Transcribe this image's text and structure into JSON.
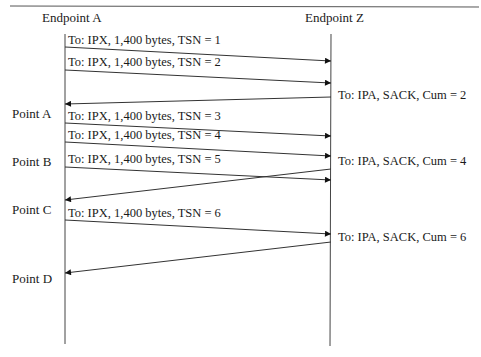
{
  "diagram": {
    "endpoints": {
      "left": {
        "label": "Endpoint A"
      },
      "right": {
        "label": "Endpoint Z"
      }
    },
    "points": [
      {
        "label": "Point A"
      },
      {
        "label": "Point B"
      },
      {
        "label": "Point C"
      },
      {
        "label": "Point D"
      }
    ],
    "messages": [
      {
        "direction": "A->Z",
        "label": "To: IPX, 1,400 bytes, TSN = 1"
      },
      {
        "direction": "A->Z",
        "label": "To: IPX, 1,400 bytes, TSN = 2"
      },
      {
        "direction": "Z->A",
        "label": "To: IPA, SACK, Cum = 2"
      },
      {
        "direction": "A->Z",
        "label": "To: IPX, 1,400 bytes, TSN = 3"
      },
      {
        "direction": "A->Z",
        "label": "To: IPX, 1,400 bytes, TSN = 4"
      },
      {
        "direction": "A->Z",
        "label": "To: IPX, 1,400 bytes, TSN = 5"
      },
      {
        "direction": "Z->A",
        "label": "To: IPA, SACK, Cum = 4"
      },
      {
        "direction": "A->Z",
        "label": "To: IPX, 1,400 bytes, TSN = 6"
      },
      {
        "direction": "Z->A",
        "label": "To: IPA, SACK, Cum = 6"
      }
    ],
    "colors": {
      "line": "#333333",
      "text": "#1a1a1a",
      "background": "#ffffff"
    }
  }
}
